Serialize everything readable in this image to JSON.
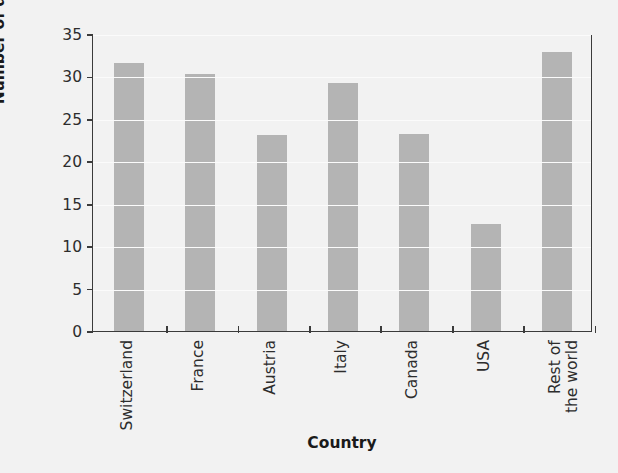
{
  "chart_data": {
    "type": "bar",
    "title": "",
    "xlabel": "Country",
    "ylabel": "Number of deaths",
    "categories": [
      "Switzerland",
      "France",
      "Austria",
      "Italy",
      "Canada",
      "USA",
      "Rest of\nthe world"
    ],
    "values": [
      31.6,
      30.3,
      23.1,
      29.2,
      23.2,
      12.6,
      32.9
    ],
    "ylim": [
      0,
      35
    ],
    "yticks": [
      0,
      5,
      10,
      15,
      20,
      25,
      30,
      35
    ],
    "ytick_labels": [
      "0",
      "5",
      "10",
      "15",
      "20",
      "25",
      "30",
      "35"
    ],
    "grid": true,
    "legend": false,
    "bar_color": "#b4b4b4",
    "axis_color": "#3b3b3b",
    "background_color": "#f2f2f2",
    "gridline_color": "#fbfbfb"
  }
}
